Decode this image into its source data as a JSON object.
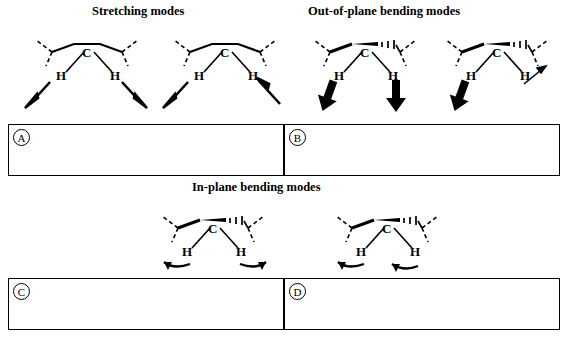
{
  "figure": {
    "title_stretching": "Stretching modes",
    "title_out_of_plane": "Out-of-plane bending modes",
    "title_in_plane": "In-plane bending modes",
    "atom_labels": {
      "carbon": "C",
      "hydrogen_left": "H",
      "hydrogen_right": "H"
    },
    "answer_boxes": [
      {
        "id": "A",
        "label": "A",
        "content": ""
      },
      {
        "id": "B",
        "label": "B",
        "content": ""
      },
      {
        "id": "C",
        "label": "C",
        "content": ""
      },
      {
        "id": "D",
        "label": "D",
        "content": ""
      }
    ],
    "molecules": [
      {
        "id": "mol-1",
        "group": "stretching",
        "mode": "symmetric-stretch",
        "arrows": "two arrows pointing down-outward from both C-H bonds"
      },
      {
        "id": "mol-2",
        "group": "stretching",
        "mode": "asymmetric-stretch",
        "arrows": "one arrow down-left, one arrow up-right"
      },
      {
        "id": "mol-3",
        "group": "out-of-plane",
        "mode": "out-of-plane-symmetric",
        "arrows": "two thick arrows pointing down"
      },
      {
        "id": "mol-4",
        "group": "out-of-plane",
        "mode": "out-of-plane-asymmetric",
        "arrows": "one thick arrow down-left, one thin arrow up-right"
      },
      {
        "id": "mol-5",
        "group": "in-plane",
        "mode": "in-plane-scissor",
        "arrows": "two curved arrows pointing outward"
      },
      {
        "id": "mol-6",
        "group": "in-plane",
        "mode": "in-plane-rock",
        "arrows": "two curved arrows pointing left"
      }
    ],
    "colors": {
      "ink": "#000000",
      "background": "#ffffff"
    }
  }
}
